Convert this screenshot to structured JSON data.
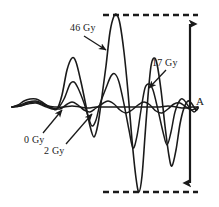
{
  "figure": {
    "background_color": "#ffffff",
    "trace_color": "#1a1a1a",
    "annotation_color": "#1a1a1a"
  },
  "annotations": {
    "dose_46": "46 Gy",
    "dose_17": "17 Gy",
    "dose_0": "0 Gy",
    "dose_2": "2 Gy",
    "amplitude": "A"
  },
  "chart_data": {
    "type": "line",
    "title": "",
    "xlabel": "",
    "ylabel": "",
    "grid": false,
    "legend": "inline annotations with leader arrows",
    "xlim": [
      0,
      219
    ],
    "ylim": [
      207,
      0
    ],
    "baseline_y": 107,
    "amplitude_marker": {
      "label": "A",
      "top_y": 15,
      "bottom_y": 192,
      "arrow_x": 190,
      "dashed_line_x_start": 103,
      "dashed_line_x_end": 198,
      "style": "double-headed vertical arrow between two horizontal dashed lines"
    },
    "series": [
      {
        "name": "0 Gy",
        "label": "0 Gy",
        "description": "near-flat baseline trace with one small early bump",
        "points": [
          [
            12,
            107
          ],
          [
            18,
            105
          ],
          [
            24,
            101
          ],
          [
            30,
            99
          ],
          [
            36,
            99
          ],
          [
            42,
            102
          ],
          [
            48,
            106
          ],
          [
            56,
            107
          ],
          [
            64,
            107
          ],
          [
            72,
            106
          ],
          [
            80,
            107
          ],
          [
            88,
            108
          ],
          [
            96,
            107
          ],
          [
            104,
            107
          ],
          [
            112,
            107
          ],
          [
            120,
            107
          ],
          [
            128,
            107
          ],
          [
            136,
            107
          ],
          [
            144,
            107
          ],
          [
            152,
            107
          ],
          [
            160,
            107
          ],
          [
            168,
            106
          ],
          [
            176,
            107
          ],
          [
            184,
            108
          ],
          [
            192,
            107
          ],
          [
            198,
            107
          ]
        ]
      },
      {
        "name": "2 Gy",
        "label": "2 Gy",
        "description": "low amplitude oscillating trace just above and below baseline",
        "points": [
          [
            12,
            107
          ],
          [
            20,
            106
          ],
          [
            28,
            103
          ],
          [
            36,
            102
          ],
          [
            44,
            105
          ],
          [
            52,
            108
          ],
          [
            60,
            109
          ],
          [
            66,
            105
          ],
          [
            72,
            102
          ],
          [
            78,
            105
          ],
          [
            84,
            110
          ],
          [
            90,
            112
          ],
          [
            96,
            108
          ],
          [
            102,
            104
          ],
          [
            108,
            101
          ],
          [
            114,
            104
          ],
          [
            120,
            110
          ],
          [
            126,
            113
          ],
          [
            132,
            110
          ],
          [
            138,
            105
          ],
          [
            144,
            102
          ],
          [
            150,
            105
          ],
          [
            156,
            111
          ],
          [
            162,
            113
          ],
          [
            168,
            109
          ],
          [
            174,
            104
          ],
          [
            180,
            103
          ],
          [
            186,
            107
          ],
          [
            192,
            110
          ],
          [
            198,
            107
          ]
        ]
      },
      {
        "name": "17 Gy",
        "label": "17 Gy",
        "description": "medium amplitude oscillating trace, three major peaks",
        "points": [
          [
            12,
            107
          ],
          [
            20,
            106
          ],
          [
            28,
            104
          ],
          [
            36,
            103
          ],
          [
            44,
            106
          ],
          [
            52,
            109
          ],
          [
            58,
            108
          ],
          [
            64,
            99
          ],
          [
            70,
            84
          ],
          [
            74,
            82
          ],
          [
            78,
            88
          ],
          [
            84,
            103
          ],
          [
            88,
            116
          ],
          [
            92,
            126
          ],
          [
            96,
            120
          ],
          [
            100,
            104
          ],
          [
            106,
            88
          ],
          [
            111,
            76
          ],
          [
            115,
            74
          ],
          [
            119,
            82
          ],
          [
            124,
            104
          ],
          [
            129,
            130
          ],
          [
            133,
            148
          ],
          [
            137,
            136
          ],
          [
            141,
            110
          ],
          [
            145,
            88
          ],
          [
            149,
            84
          ],
          [
            153,
            90
          ],
          [
            158,
            110
          ],
          [
            163,
            132
          ],
          [
            167,
            145
          ],
          [
            171,
            132
          ],
          [
            175,
            112
          ],
          [
            180,
            100
          ],
          [
            184,
            100
          ],
          [
            189,
            107
          ],
          [
            194,
            112
          ],
          [
            198,
            108
          ]
        ]
      },
      {
        "name": "46 Gy",
        "label": "46 Gy",
        "description": "largest amplitude oscillating trace; main peak reaches upper dashed line and main trough reaches lower dashed line",
        "points": [
          [
            12,
            107
          ],
          [
            20,
            105
          ],
          [
            28,
            102
          ],
          [
            36,
            101
          ],
          [
            44,
            104
          ],
          [
            52,
            108
          ],
          [
            57,
            109
          ],
          [
            62,
            95
          ],
          [
            67,
            70
          ],
          [
            72,
            58
          ],
          [
            76,
            62
          ],
          [
            81,
            82
          ],
          [
            86,
            106
          ],
          [
            90,
            126
          ],
          [
            94,
            137
          ],
          [
            98,
            124
          ],
          [
            102,
            96
          ],
          [
            106,
            66
          ],
          [
            110,
            32
          ],
          [
            114,
            16
          ],
          [
            117,
            15
          ],
          [
            120,
            24
          ],
          [
            124,
            52
          ],
          [
            128,
            92
          ],
          [
            132,
            140
          ],
          [
            136,
            178
          ],
          [
            139,
            192
          ],
          [
            142,
            176
          ],
          [
            145,
            136
          ],
          [
            148,
            96
          ],
          [
            151,
            66
          ],
          [
            154,
            58
          ],
          [
            157,
            64
          ],
          [
            161,
            90
          ],
          [
            165,
            126
          ],
          [
            169,
            156
          ],
          [
            172,
            166
          ],
          [
            176,
            150
          ],
          [
            180,
            124
          ],
          [
            184,
            108
          ],
          [
            188,
            101
          ],
          [
            192,
            104
          ],
          [
            196,
            110
          ],
          [
            198,
            108
          ]
        ]
      }
    ]
  },
  "leader_arrows": [
    {
      "name": "arrow-46gy",
      "from": [
        84,
        36
      ],
      "to": [
        106,
        50
      ],
      "label": "46 Gy"
    },
    {
      "name": "arrow-17gy",
      "from": [
        166,
        70
      ],
      "to": [
        149,
        88
      ],
      "label": "17 Gy"
    },
    {
      "name": "arrow-0gy",
      "from": [
        43,
        133
      ],
      "to": [
        62,
        110
      ],
      "label": "0 Gy"
    },
    {
      "name": "arrow-2gy",
      "from": [
        66,
        144
      ],
      "to": [
        92,
        114
      ],
      "label": "2 Gy"
    }
  ]
}
